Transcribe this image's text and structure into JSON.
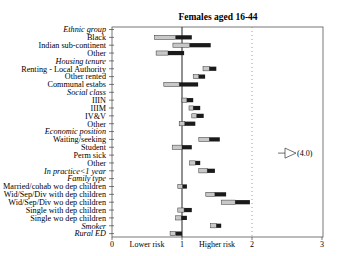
{
  "chart_data": {
    "type": "bar",
    "subtype": "horizontal floating range bars (odds ratio with confidence interval)",
    "title": "Females aged 16-44",
    "xlabel": "",
    "x_annotations": [
      "Lower risk",
      "Higher risk"
    ],
    "xlim": [
      0,
      3
    ],
    "x_ticks": [
      "0",
      "1",
      "2",
      "3"
    ],
    "reference_lines": [
      {
        "x": 1,
        "style": "solid"
      },
      {
        "x": 2,
        "style": "dotted"
      }
    ],
    "grid": false,
    "legend": null,
    "series_colors": {
      "lower_segment": "#c8c8c8",
      "upper_segment": "#1a1a1a"
    },
    "rows": [
      {
        "label": "Ethnic group",
        "heading": true
      },
      {
        "label": "Black",
        "low": 0.61,
        "mid": 0.91,
        "high": 1.14
      },
      {
        "label": "Indian sub-continent",
        "low": 0.87,
        "mid": 1.11,
        "high": 1.41
      },
      {
        "label": "Other",
        "low": 0.63,
        "mid": 0.8,
        "high": 1.03
      },
      {
        "label": "Housing tenure",
        "heading": true
      },
      {
        "label": "Renting - Local Authority",
        "low": 1.3,
        "mid": 1.39,
        "high": 1.49
      },
      {
        "label": "Other rented",
        "low": 1.16,
        "mid": 1.24,
        "high": 1.33
      },
      {
        "label": "Communal estabs",
        "low": 0.74,
        "mid": 0.96,
        "high": 1.23
      },
      {
        "label": "Social class",
        "heading": true
      },
      {
        "label": "IIIN",
        "low": 1.0,
        "mid": 1.07,
        "high": 1.16
      },
      {
        "label": "IIIM",
        "low": 1.1,
        "mid": 1.16,
        "high": 1.26
      },
      {
        "label": "IV&V",
        "low": 1.14,
        "mid": 1.21,
        "high": 1.31
      },
      {
        "label": "Other",
        "low": 0.96,
        "mid": 1.04,
        "high": 1.19
      },
      {
        "label": "Economic position",
        "heading": true
      },
      {
        "label": "Waiting/seeking",
        "low": 1.24,
        "mid": 1.39,
        "high": 1.54
      },
      {
        "label": "Student",
        "low": 0.86,
        "mid": 1.0,
        "high": 1.14
      },
      {
        "label": "Perm sick",
        "offscale": true,
        "offscale_label": "(4.0)"
      },
      {
        "label": "Other",
        "low": 1.11,
        "mid": 1.19,
        "high": 1.26
      },
      {
        "label": "In practice<1 year",
        "italic": true,
        "low": 1.24,
        "mid": 1.36,
        "high": 1.47
      },
      {
        "label": "Family type",
        "heading": true
      },
      {
        "label": "Married/cohab wo dep children",
        "low": 0.94,
        "mid": 1.01,
        "high": 1.07
      },
      {
        "label": "Wid/Sep/Div with dep children",
        "low": 1.34,
        "mid": 1.47,
        "high": 1.63
      },
      {
        "label": "Wid/Sep/Div wo dep children",
        "low": 1.56,
        "mid": 1.76,
        "high": 1.97
      },
      {
        "label": "Single with dep children",
        "low": 0.94,
        "mid": 1.03,
        "high": 1.14
      },
      {
        "label": "Single wo dep children",
        "low": 0.91,
        "mid": 0.99,
        "high": 1.07
      },
      {
        "label": "Smoker",
        "italic": true,
        "low": 1.41,
        "mid": 1.49,
        "high": 1.56
      },
      {
        "label": "Rural ED",
        "italic": true,
        "low": 0.83,
        "mid": 0.91,
        "high": 1.0
      }
    ]
  }
}
